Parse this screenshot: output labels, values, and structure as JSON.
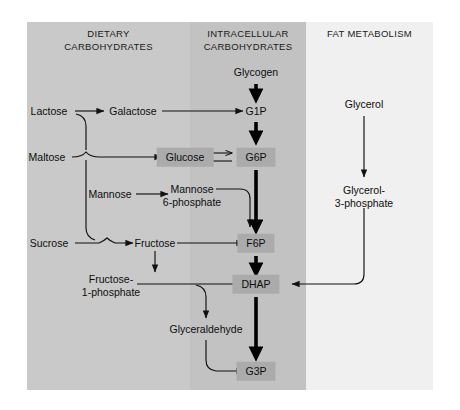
{
  "diagram": {
    "columns": [
      {
        "id": "dietary",
        "label": "DIETARY\nCARBOHYDRATES",
        "background": "#c9c9c9"
      },
      {
        "id": "intracellular",
        "label": "INTRACELLULAR\nCARBOHYDRATES",
        "background": "#c2c2c2"
      },
      {
        "id": "fat",
        "label": "FAT METABOLISM",
        "background": "#f0f0f0"
      }
    ],
    "node_box_color": "#ababab",
    "nodes": {
      "lactose": "Lactose",
      "maltose": "Maltose",
      "sucrose": "Sucrose",
      "mannose": "Mannose",
      "galactose": "Galactose",
      "fructose": "Fructose",
      "mannose6p": "Mannose\n6-phosphate",
      "fructose1p": "Fructose-\n1-phosphate",
      "glyceraldehyde": "Glyceraldehyde",
      "glycogen": "Glycogen",
      "g1p": "G1P",
      "glucose": "Glucose",
      "g6p": "G6P",
      "f6p": "F6P",
      "dhap": "DHAP",
      "g3p": "G3P",
      "glycerol": "Glycerol",
      "glycerol3p": "Glycerol-\n3-phosphate"
    },
    "reactions": [
      {
        "from": "lactose",
        "to": "galactose",
        "kind": "thin"
      },
      {
        "from": "lactose",
        "to": "glucose",
        "kind": "thin"
      },
      {
        "from": "maltose",
        "to": "glucose",
        "kind": "thin"
      },
      {
        "from": "sucrose",
        "to": "fructose",
        "kind": "thin"
      },
      {
        "from": "sucrose",
        "to": "glucose",
        "kind": "thin"
      },
      {
        "from": "mannose",
        "to": "mannose6p",
        "kind": "thin"
      },
      {
        "from": "galactose",
        "to": "g1p",
        "kind": "thin"
      },
      {
        "from": "mannose6p",
        "to": "f6p",
        "kind": "thin"
      },
      {
        "from": "fructose",
        "to": "f6p",
        "kind": "thin"
      },
      {
        "from": "fructose",
        "to": "fructose1p",
        "kind": "thin"
      },
      {
        "from": "fructose1p",
        "to": "dhap",
        "kind": "thin"
      },
      {
        "from": "fructose1p",
        "to": "glyceraldehyde",
        "kind": "thin"
      },
      {
        "from": "glyceraldehyde",
        "to": "g3p",
        "kind": "thin"
      },
      {
        "from": "glycogen",
        "to": "g1p",
        "kind": "thick"
      },
      {
        "from": "g1p",
        "to": "g6p",
        "kind": "thick"
      },
      {
        "from": "glucose",
        "to": "g6p",
        "kind": "reversible"
      },
      {
        "from": "g6p",
        "to": "f6p",
        "kind": "thick"
      },
      {
        "from": "f6p",
        "to": "dhap",
        "kind": "thick"
      },
      {
        "from": "dhap",
        "to": "g3p",
        "kind": "thick"
      },
      {
        "from": "glycerol",
        "to": "glycerol3p",
        "kind": "thin"
      },
      {
        "from": "glycerol3p",
        "to": "dhap",
        "kind": "thin"
      }
    ]
  }
}
